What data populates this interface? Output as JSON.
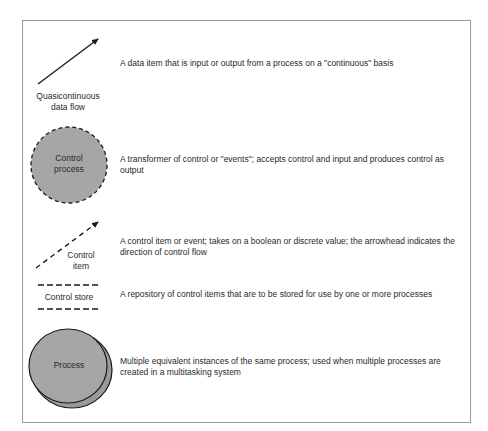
{
  "diagram": {
    "colors": {
      "fill": "#a6a6a6",
      "stroke": "#1a1a1a",
      "frame": "#9a9a9a"
    },
    "entries": [
      {
        "symbol": "solid-arrow",
        "label_line1": "Quasicontinuous",
        "label_line2": "data flow",
        "description": "A data item that is input or output from a process on a \"continuous\" basis"
      },
      {
        "symbol": "dashed-circle",
        "label_line1": "Control",
        "label_line2": "process",
        "description": "A transformer of control or \"events\"; accepts control and input and produces control as output"
      },
      {
        "symbol": "dashed-arrow",
        "label_line1": "Control",
        "label_line2": "item",
        "description": "A control item or event; takes on a boolean or discrete value; the arrowhead indicates the direction of control flow"
      },
      {
        "symbol": "dashed-parallel-lines",
        "label_line1": "Control store",
        "description": "A repository of control items that are to be stored for use by one or more processes"
      },
      {
        "symbol": "stacked-circles",
        "label_line1": "Process",
        "description": "Multiple equivalent instances of the same process; used when multiple processes are created in a multitasking system"
      }
    ]
  }
}
